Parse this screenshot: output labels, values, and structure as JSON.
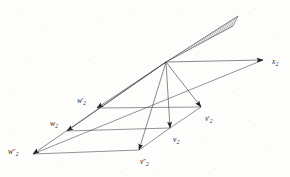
{
  "figure": {
    "background_color": "#fdfdfc",
    "line_color": "#3a3a3a",
    "hatch_color": "#555555",
    "apex": {
      "x": 166,
      "y": 62
    },
    "labels": [
      {
        "name": "x2",
        "base": "x",
        "primes": "",
        "sub": "2",
        "x": 272,
        "y": 58
      },
      {
        "name": "v2-prime",
        "base": "v",
        "primes": "′",
        "sub": "2",
        "x": 205,
        "y": 115
      },
      {
        "name": "v2",
        "base": "v",
        "primes": "",
        "sub": "2",
        "x": 173,
        "y": 136
      },
      {
        "name": "v2-dprime",
        "base": "v",
        "primes": "″",
        "sub": "2",
        "x": 140,
        "y": 158
      },
      {
        "name": "w2-prime",
        "base": "w",
        "primes": "′",
        "sub": "2",
        "x": 77,
        "y": 97
      },
      {
        "name": "w2",
        "base": "w",
        "primes": "",
        "sub": "2",
        "x": 50,
        "y": 120
      },
      {
        "name": "w2-dprime",
        "base": "w",
        "primes": "″",
        "sub": "2",
        "x": 8,
        "y": 148
      }
    ],
    "vectors": [
      {
        "name": "arrow-to-x2",
        "from": [
          166,
          62
        ],
        "to": [
          263,
          60
        ]
      },
      {
        "name": "arrow-to-v2-prime",
        "from": [
          166,
          62
        ],
        "to": [
          201,
          107
        ]
      },
      {
        "name": "arrow-to-v2",
        "from": [
          166,
          62
        ],
        "to": [
          170,
          128
        ]
      },
      {
        "name": "arrow-to-v2-dprime",
        "from": [
          166,
          62
        ],
        "to": [
          139,
          150
        ]
      },
      {
        "name": "arrow-to-w2-prime",
        "from": [
          166,
          62
        ],
        "to": [
          97,
          108
        ]
      },
      {
        "name": "arrow-to-w2",
        "from": [
          166,
          62
        ],
        "to": [
          67,
          131
        ]
      },
      {
        "name": "arrow-to-w2-dprime",
        "from": [
          166,
          62
        ],
        "to": [
          33,
          154
        ]
      }
    ],
    "connectors": [
      {
        "name": "connector-prime-row",
        "from": [
          97,
          108
        ],
        "to": [
          201,
          107
        ]
      },
      {
        "name": "connector-mid-row",
        "from": [
          67,
          131
        ],
        "to": [
          170,
          128
        ]
      },
      {
        "name": "connector-dprime-row",
        "from": [
          33,
          154
        ],
        "to": [
          139,
          150
        ]
      },
      {
        "name": "edge-lower-right",
        "from": [
          33,
          154
        ],
        "to": [
          263,
          60
        ]
      },
      {
        "name": "edge-v-chain-a",
        "from": [
          139,
          150
        ],
        "to": [
          170,
          128
        ]
      },
      {
        "name": "edge-v-chain-b",
        "from": [
          170,
          128
        ],
        "to": [
          201,
          107
        ]
      }
    ],
    "cone": {
      "name": "hatched-cone",
      "apex": [
        166,
        62
      ],
      "edge_upper": [
        238,
        16
      ],
      "edge_lower": [
        233,
        26
      ],
      "hatch_count": 26
    }
  }
}
